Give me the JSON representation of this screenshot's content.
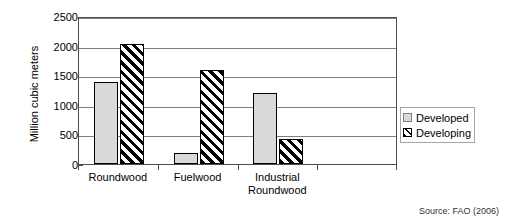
{
  "chart_data": {
    "type": "bar",
    "title": "",
    "xlabel": "",
    "ylabel": "Million cubic meters",
    "ylim": [
      0,
      2500
    ],
    "ytick_step": 500,
    "yticks": [
      "2500",
      "2000",
      "1500",
      "1000",
      "500",
      "0"
    ],
    "grid": true,
    "legend_position": "right",
    "categories": [
      "Roundwood",
      "Fuelwood",
      "Industrial Roundwood"
    ],
    "category_labels": [
      {
        "line1": "Roundwood",
        "line2": ""
      },
      {
        "line1": "Fuelwood",
        "line2": ""
      },
      {
        "line1": "Industrial",
        "line2": "Roundwood"
      }
    ],
    "series": [
      {
        "name": "Developed",
        "values": [
          1390,
          185,
          1205
        ],
        "fill": "#d9d9d9",
        "pattern": "solid"
      },
      {
        "name": "Developing",
        "values": [
          2030,
          1580,
          430
        ],
        "fill": "#ffffff",
        "pattern": "diagonal-hatch"
      }
    ],
    "source": "Source: FAO (2006)"
  },
  "legend": {
    "items": [
      {
        "label": "Developed"
      },
      {
        "label": "Developing"
      }
    ]
  },
  "footer": {
    "source": "Source: FAO (2006)"
  },
  "colors": {
    "developed_fill": "#d9d9d9",
    "developing_fill": "#ffffff",
    "bar_border": "#000000",
    "gridline": "#808080",
    "axis": "#4d4d4d",
    "text": "#000000"
  }
}
